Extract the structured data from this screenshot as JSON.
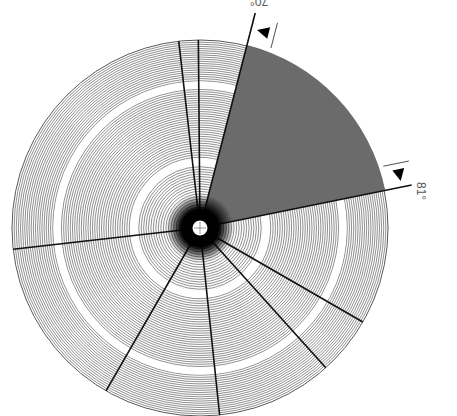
{
  "diagram": {
    "type": "polar-fan-diagram",
    "center": [
      200,
      228
    ],
    "outer_radius": 188,
    "ring_count": 80,
    "ring_gaps": [
      {
        "radius": 66,
        "width": 7
      },
      {
        "radius": 143,
        "width": 7
      }
    ],
    "sector": {
      "start_label": "70°",
      "end_label": "81°",
      "start_angle_deg": 75.6,
      "end_angle_deg": 11.5,
      "fill_color": "#6b6b6b"
    },
    "radial_lines_angles_deg": [
      96.5,
      90.5,
      186.5,
      240.0,
      276.0,
      312.0,
      330.0
    ],
    "line_color": "#111111",
    "ring_color": "#444444",
    "hub_color": "#000000",
    "hub_center_color": "#ffffff",
    "markers": [
      {
        "name": "start-marker",
        "label": "70°",
        "angle_deg": 75.6
      },
      {
        "name": "end-marker",
        "label": "81°",
        "angle_deg": 11.5
      }
    ]
  }
}
